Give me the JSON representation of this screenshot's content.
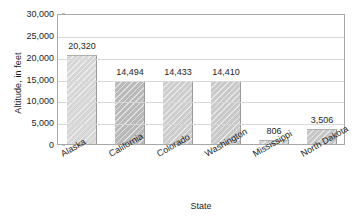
{
  "chart_data": {
    "type": "bar",
    "title": "",
    "xlabel": "State",
    "ylabel": "Altitude, in feet",
    "categories": [
      "Alaska",
      "California",
      "Colorado",
      "Washington",
      "Mississippi",
      "North Dakota"
    ],
    "values": [
      20320,
      14494,
      14433,
      14410,
      806,
      3506
    ],
    "value_labels": [
      "20,320",
      "14,494",
      "14,433",
      "14,410",
      "806",
      "3,506"
    ],
    "ylim": [
      0,
      30000
    ],
    "ytick_values": [
      0,
      5000,
      10000,
      15000,
      20000,
      25000,
      30000
    ],
    "ytick_labels": [
      "0",
      "5,000",
      "10,000",
      "15,000",
      "20,000",
      "25,000",
      "30,000"
    ],
    "grid": "horizontal",
    "legend": "none",
    "bar_colors": [
      "#d6d6d6",
      "#b9b9b9",
      "#cdcdcd",
      "#c9c9c9",
      "#d2d2d2",
      "#c6c6c6"
    ],
    "colors": {
      "background": "#ffffff",
      "gridline": "#d8d8d8",
      "frame": "#a8a8a8",
      "text": "#1e1e1e"
    }
  }
}
